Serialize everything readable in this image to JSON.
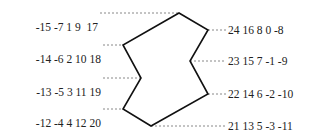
{
  "diagram": {
    "left_rows": [
      {
        "label": "-15 -7 1 9",
        "end": "17",
        "y": 13
      },
      {
        "label": "-14 -6 2 10",
        "end": "18",
        "y": 45
      },
      {
        "label": "-13 -5 3 11",
        "end": "19",
        "y": 78
      },
      {
        "label": "-12 -4 4 12",
        "end": "20",
        "y": 109
      }
    ],
    "right_rows": [
      {
        "label": "24 16 8 0 -8",
        "y": 30
      },
      {
        "label": "23 15 7 -1 -9",
        "y": 61
      },
      {
        "label": "22 14 6 -2 -10",
        "y": 94
      },
      {
        "label": "21 13 5 -3 -11",
        "y": 126
      }
    ],
    "polygon_vertices": [
      [
        179,
        13
      ],
      [
        208,
        30
      ],
      [
        190,
        61
      ],
      [
        208,
        94
      ],
      [
        151,
        126
      ],
      [
        123,
        109
      ],
      [
        141,
        78
      ],
      [
        123,
        45
      ]
    ],
    "colors": {
      "line": "#111111",
      "dash": "#888888",
      "text": "#222222"
    }
  }
}
